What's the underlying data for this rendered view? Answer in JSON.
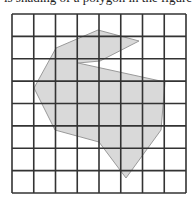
{
  "caption": {
    "text": "is shading of a polygon in the figure"
  },
  "figure": {
    "grid": {
      "cols": 8,
      "rows": 8,
      "left": 12,
      "top": 14,
      "right": 186,
      "bottom": 193,
      "line_color": "#333333"
    },
    "polygon": {
      "fill": "#d9d9d9",
      "stroke": "#9a9a9a",
      "points": "98,30 139,41 100,61 78,63 165,82 161,130 126,178 99,142 55,130 34,88 56,48"
    }
  }
}
